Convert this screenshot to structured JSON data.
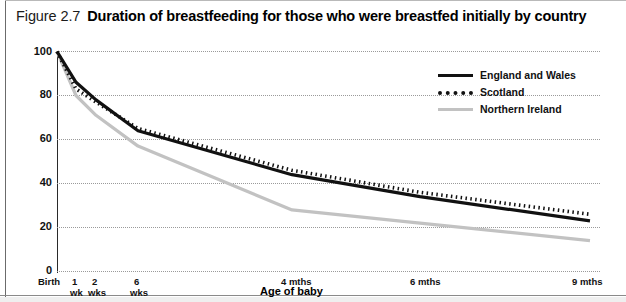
{
  "figure": {
    "number": "Figure 2.7",
    "title": "Duration of breastfeeding for those who were breastfed initially by country"
  },
  "legend": {
    "position": "top-right",
    "items": [
      {
        "label": "England and Wales",
        "style": "solid",
        "color": "#111111",
        "swatch": "line-solid-black-icon"
      },
      {
        "label": "Scotland",
        "style": "dotted",
        "color": "#111111",
        "swatch": "line-dotted-black-icon"
      },
      {
        "label": "Northern Ireland",
        "style": "solid",
        "color": "#c2c2c2",
        "swatch": "line-solid-gray-icon"
      }
    ]
  },
  "axes": {
    "y": {
      "title": "Percentage breastfeeding",
      "ticks": [
        "0",
        "20",
        "40",
        "60",
        "80",
        "100"
      ],
      "min": 0,
      "max": 100
    },
    "x": {
      "title": "Age of baby",
      "ticks": [
        {
          "line1": "Birth",
          "line2": ""
        },
        {
          "line1": "1",
          "line2": "wk"
        },
        {
          "line1": "2",
          "line2": "wks"
        },
        {
          "line1": "6",
          "line2": "wks"
        },
        {
          "line1": "4 mths",
          "line2": ""
        },
        {
          "line1": "6 mths",
          "line2": ""
        },
        {
          "line1": "9 mths",
          "line2": ""
        }
      ]
    }
  },
  "chart_data": {
    "type": "line",
    "title": "Duration of breastfeeding for those who were breastfed initially by country",
    "xlabel": "Age of baby",
    "ylabel": "Percentage breastfeeding",
    "ylim": [
      0,
      100
    ],
    "grid": true,
    "legend_position": "top-right",
    "categories": [
      "Birth",
      "1 wk",
      "2 wks",
      "6 wks",
      "4 mths",
      "6 mths",
      "9 mths"
    ],
    "x_positions_weeks": [
      0,
      1,
      2,
      6,
      17,
      26,
      39
    ],
    "series": [
      {
        "name": "England and Wales",
        "style": "solid",
        "color": "#111111",
        "x": [
          0,
          1,
          2,
          6,
          17,
          26,
          39
        ],
        "values": [
          100,
          86,
          78,
          64,
          44,
          34,
          23
        ]
      },
      {
        "name": "Scotland",
        "style": "dotted",
        "color": "#111111",
        "x": [
          0,
          1,
          2,
          6,
          17,
          26,
          39
        ],
        "values": [
          100,
          83,
          77,
          65,
          46,
          36,
          26
        ]
      },
      {
        "name": "Northern Ireland",
        "style": "solid",
        "color": "#c2c2c2",
        "x": [
          0,
          1,
          2,
          6,
          17,
          26,
          39
        ],
        "values": [
          100,
          80,
          71,
          57,
          28,
          22,
          14
        ]
      }
    ]
  }
}
